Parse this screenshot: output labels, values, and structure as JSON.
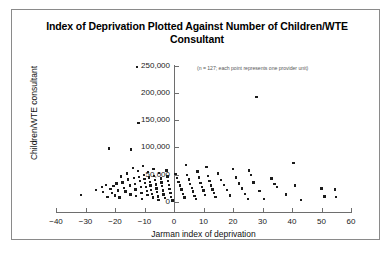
{
  "figure": {
    "title": "Index of Deprivation Plotted Against Number of Children/WTE Consultant",
    "annotation": "(n = 127; each point represents one provider unit)",
    "border_color": "#8a8a8a",
    "point_color": "#1b1b1b"
  },
  "chart_data": {
    "type": "scatter",
    "title": "Index of Deprivation Plotted Against Number of Children/WTE Consultant",
    "subtitle": "(n = 127; each point represents one provider unit)",
    "xlabel": "Jarman index of deprivation",
    "ylabel": "Children/WTE consultant",
    "xlim": [
      -40,
      60
    ],
    "ylim": [
      0,
      250000
    ],
    "xticks": [
      -40,
      -30,
      -20,
      -10,
      0,
      10,
      20,
      30,
      40,
      50,
      60
    ],
    "xtick_labels": [
      "−40",
      "−30",
      "−20",
      "−10",
      "0",
      "10",
      "20",
      "30",
      "40",
      "50",
      "60"
    ],
    "yticks": [
      0,
      50000,
      100000,
      150000,
      200000,
      250000
    ],
    "ytick_labels": [
      "0",
      "50,000",
      "100,000",
      "150,000",
      "200,000",
      "250,000"
    ],
    "grid": false,
    "legend": false,
    "n_points": 127,
    "points": [
      [
        -12.5,
        247000
      ],
      [
        -12.0,
        145000
      ],
      [
        28.0,
        192000
      ],
      [
        -22.0,
        98000
      ],
      [
        -14.5,
        96000
      ],
      [
        -31.5,
        13000
      ],
      [
        -26.5,
        22000
      ],
      [
        -24.5,
        27000
      ],
      [
        -24.0,
        18000
      ],
      [
        -23.0,
        31000
      ],
      [
        -22.5,
        9000
      ],
      [
        -21.5,
        24000
      ],
      [
        -21.0,
        16000
      ],
      [
        -20.5,
        29000
      ],
      [
        -20.0,
        12000
      ],
      [
        -19.5,
        34000
      ],
      [
        -19.0,
        21000
      ],
      [
        -18.5,
        8000
      ],
      [
        -18.0,
        47000
      ],
      [
        -17.5,
        36000
      ],
      [
        -17.0,
        26000
      ],
      [
        -16.5,
        19000
      ],
      [
        -16.0,
        52000
      ],
      [
        -15.5,
        41000
      ],
      [
        -15.0,
        30000
      ],
      [
        -14.8,
        14000
      ],
      [
        -14.0,
        62000
      ],
      [
        -13.5,
        44000
      ],
      [
        -13.2,
        33000
      ],
      [
        -13.0,
        23000
      ],
      [
        -12.8,
        11000
      ],
      [
        -12.2,
        57000
      ],
      [
        -11.8,
        46000
      ],
      [
        -11.5,
        38000
      ],
      [
        -11.2,
        28000
      ],
      [
        -11.0,
        17000
      ],
      [
        -10.8,
        6000
      ],
      [
        -10.5,
        66000
      ],
      [
        -10.2,
        50000
      ],
      [
        -10.0,
        42000
      ],
      [
        -9.8,
        35000
      ],
      [
        -9.5,
        27000
      ],
      [
        -9.2,
        20000
      ],
      [
        -9.0,
        13000
      ],
      [
        -8.8,
        55000
      ],
      [
        -8.5,
        45000
      ],
      [
        -8.2,
        37000
      ],
      [
        -8.0,
        30000
      ],
      [
        -7.8,
        22000
      ],
      [
        -7.5,
        15000
      ],
      [
        -7.2,
        8000
      ],
      [
        -7.0,
        60000
      ],
      [
        -6.8,
        48000
      ],
      [
        -6.5,
        40000
      ],
      [
        -6.2,
        32000
      ],
      [
        -6.0,
        25000
      ],
      [
        -5.8,
        18000
      ],
      [
        -5.5,
        10000
      ],
      [
        -5.2,
        4000
      ],
      [
        -5.0,
        53000
      ],
      [
        -4.5,
        43000
      ],
      [
        -4.2,
        36000
      ],
      [
        -4.0,
        29000
      ],
      [
        -3.8,
        21000
      ],
      [
        -3.5,
        14000
      ],
      [
        -3.0,
        7000
      ],
      [
        -2.5,
        58000
      ],
      [
        -2.2,
        47000
      ],
      [
        -2.0,
        39000
      ],
      [
        -1.8,
        31000
      ],
      [
        -1.5,
        24000
      ],
      [
        -1.2,
        16000
      ],
      [
        -1.0,
        9000
      ],
      [
        -0.5,
        3000
      ],
      [
        0.5,
        51000
      ],
      [
        1.0,
        44000
      ],
      [
        1.5,
        37000
      ],
      [
        2.0,
        30000
      ],
      [
        2.5,
        23000
      ],
      [
        3.0,
        15000
      ],
      [
        3.5,
        8000
      ],
      [
        4.0,
        68000
      ],
      [
        4.5,
        49000
      ],
      [
        5.0,
        41000
      ],
      [
        5.5,
        33000
      ],
      [
        6.0,
        26000
      ],
      [
        6.5,
        19000
      ],
      [
        7.0,
        11000
      ],
      [
        7.5,
        5000
      ],
      [
        8.0,
        56000
      ],
      [
        8.5,
        45000
      ],
      [
        9.0,
        35000
      ],
      [
        9.5,
        28000
      ],
      [
        10.0,
        21000
      ],
      [
        10.5,
        13000
      ],
      [
        11.0,
        64000
      ],
      [
        11.5,
        48000
      ],
      [
        12.0,
        38000
      ],
      [
        12.5,
        30000
      ],
      [
        13.0,
        23000
      ],
      [
        13.5,
        16000
      ],
      [
        14.0,
        9000
      ],
      [
        15.0,
        52000
      ],
      [
        16.0,
        40000
      ],
      [
        17.0,
        31000
      ],
      [
        18.0,
        22000
      ],
      [
        19.0,
        12000
      ],
      [
        20.0,
        61000
      ],
      [
        21.0,
        45000
      ],
      [
        22.0,
        34000
      ],
      [
        23.0,
        25000
      ],
      [
        24.0,
        15000
      ],
      [
        25.0,
        6000
      ],
      [
        25.5,
        58000
      ],
      [
        26.0,
        50000
      ],
      [
        27.0,
        36000
      ],
      [
        29.0,
        20000
      ],
      [
        30.5,
        5000
      ],
      [
        33.0,
        43000
      ],
      [
        34.0,
        33000
      ],
      [
        35.0,
        27000
      ],
      [
        38.0,
        14000
      ],
      [
        40.5,
        72000
      ],
      [
        41.0,
        30000
      ],
      [
        43.0,
        4000
      ],
      [
        50.0,
        25000
      ],
      [
        51.0,
        10000
      ],
      [
        54.5,
        23000
      ],
      [
        55.0,
        9000
      ]
    ]
  }
}
